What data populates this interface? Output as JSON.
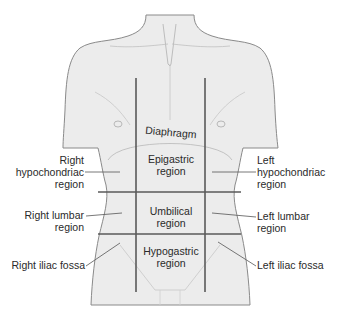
{
  "diagram": {
    "colors": {
      "body_fill": "#ececec",
      "body_outline": "#8a8a8a",
      "grid_lines": "#5a5a5a",
      "leader_lines": "#555555",
      "text": "#2a2a2a"
    },
    "labels": {
      "diaphragm": "Diaphragm",
      "epigastric": [
        "Epigastric",
        "region"
      ],
      "umbilical": [
        "Umbilical",
        "region"
      ],
      "hypogastric": [
        "Hypogastric",
        "region"
      ],
      "right_hypochondriac": [
        "Right",
        "hypochondriac",
        "region"
      ],
      "left_hypochondriac": [
        "Left",
        "hypochondriac",
        "region"
      ],
      "right_lumbar": [
        "Right lumbar",
        "region"
      ],
      "left_lumbar": [
        "Left lumbar",
        "region"
      ],
      "right_iliac": "Right iliac fossa",
      "left_iliac": "Left iliac fossa"
    }
  }
}
